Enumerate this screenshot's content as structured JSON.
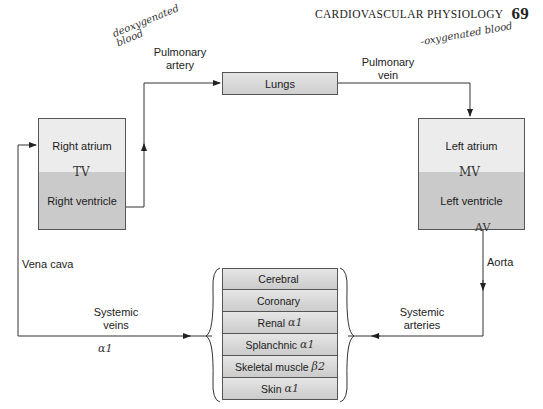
{
  "header": {
    "title": "CARDIOVASCULAR PHYSIOLOGY",
    "page_number": "69"
  },
  "annotations": {
    "deoxygenated": "deoxygenated blood",
    "oxygenated": "-oxygenated blood",
    "tricuspid_valve": "TV",
    "mitral_valve": "MV",
    "aortic_valve": "AV",
    "systemic_veins_receptor": "α1"
  },
  "nodes": {
    "lungs": "Lungs",
    "right_atrium": "Right atrium",
    "right_ventricle": "Right ventricle",
    "left_atrium": "Left atrium",
    "left_ventricle": "Left ventricle"
  },
  "vessels": {
    "pulmonary_artery": "Pulmonary artery",
    "pulmonary_artery_l1": "Pulmonary",
    "pulmonary_artery_l2": "artery",
    "pulmonary_vein_l1": "Pulmonary",
    "pulmonary_vein_l2": "vein",
    "vena_cava": "Vena cava",
    "aorta": "Aorta",
    "systemic_veins_l1": "Systemic",
    "systemic_veins_l2": "veins",
    "systemic_arteries_l1": "Systemic",
    "systemic_arteries_l2": "arteries"
  },
  "organs": [
    {
      "name": "Cerebral",
      "receptor": ""
    },
    {
      "name": "Coronary",
      "receptor": ""
    },
    {
      "name": "Renal",
      "receptor": "α1"
    },
    {
      "name": "Splanchnic",
      "receptor": "α1"
    },
    {
      "name": "Skeletal muscle",
      "receptor": "β2"
    },
    {
      "name": "Skin",
      "receptor": "α1"
    }
  ],
  "colors": {
    "line": "#333333",
    "chamber_light": "#ececec",
    "chamber_dark": "#cacaca"
  }
}
